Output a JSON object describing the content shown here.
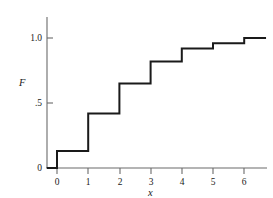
{
  "chart_data": {
    "type": "line",
    "subtype": "step-post",
    "title": "",
    "subtitle": "",
    "xlabel": "x",
    "ylabel": "F",
    "xlim": [
      -0.33,
      6.7
    ],
    "ylim": [
      0,
      1.12
    ],
    "grid": false,
    "legend": null,
    "x_ticks": [
      0,
      1,
      2,
      3,
      4,
      5,
      6
    ],
    "x_tick_labels": [
      "0",
      "1",
      "2",
      "3",
      "4",
      "5",
      "6"
    ],
    "y_ticks": [
      0,
      0.5,
      1.0
    ],
    "y_tick_labels": [
      "0",
      ".5",
      "1.0"
    ],
    "line_color": "#1a1a1a",
    "axis_color": "#6b6b6b",
    "series": [
      {
        "name": "F",
        "jump_points": [
          0,
          1,
          2,
          3,
          4,
          5,
          6
        ],
        "values": [
          0.13,
          0.42,
          0.65,
          0.82,
          0.92,
          0.96,
          1.0
        ],
        "baseline": 0.0,
        "x_start": -0.33,
        "x_end": 6.7
      }
    ]
  }
}
